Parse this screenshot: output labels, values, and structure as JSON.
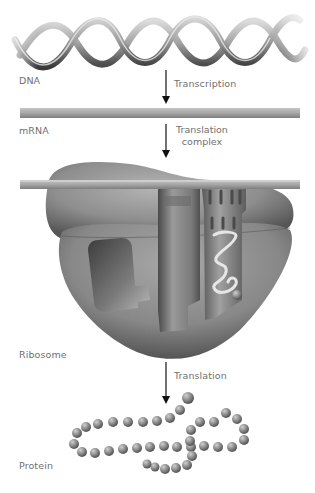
{
  "diagram": {
    "stages": [
      {
        "id": "dna",
        "label": "DNA"
      },
      {
        "id": "mrna",
        "label": "mRNA"
      },
      {
        "id": "ribosome",
        "label": "Ribosome"
      },
      {
        "id": "protein",
        "label": "Protein"
      }
    ],
    "steps": [
      {
        "id": "transcription",
        "label": "Transcription"
      },
      {
        "id": "translation-complex",
        "line1": "Translation",
        "line2": "complex"
      },
      {
        "id": "translation",
        "label": "Translation"
      }
    ],
    "colors": {
      "label_text": "#707070",
      "arrow": "#111111",
      "mrna_bar": "#a8a8a8",
      "ribosome_body": "#8a8a8a",
      "dna_strand": "#9a9a9a",
      "protein_bead": "#8c8c8c"
    }
  }
}
